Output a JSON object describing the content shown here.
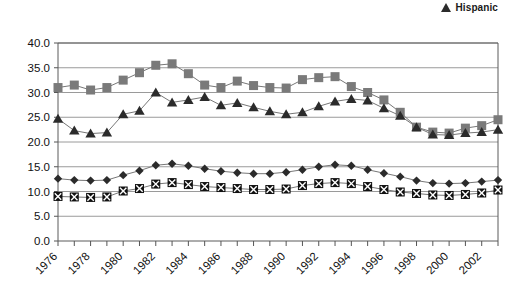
{
  "legend": {
    "items": [
      {
        "label": "Hispanic",
        "marker": "triangle-icon",
        "color": "#2b2b2b"
      }
    ]
  },
  "chart_data": {
    "type": "line",
    "title": "",
    "subtitle": "",
    "xlabel": "",
    "ylabel": "",
    "grid": true,
    "legend_position": "top-right",
    "xlim": [
      1976,
      2003
    ],
    "ylim": [
      0.0,
      40.0
    ],
    "ytick_labels": [
      "40.0",
      "35.0",
      "30.0",
      "25.0",
      "20.0",
      "15.0",
      "10.0",
      "5.0",
      "0.0"
    ],
    "ytick_values": [
      40.0,
      35.0,
      30.0,
      25.0,
      20.0,
      15.0,
      10.0,
      5.0,
      0.0
    ],
    "xtick_labels": [
      "1976",
      "1978",
      "1980",
      "1982",
      "1984",
      "1986",
      "1988",
      "1990",
      "1992",
      "1994",
      "1996",
      "1998",
      "2000",
      "2002"
    ],
    "xtick_values": [
      1976,
      1978,
      1980,
      1982,
      1984,
      1986,
      1988,
      1990,
      1992,
      1994,
      1996,
      1998,
      2000,
      2002
    ],
    "x": [
      1976,
      1977,
      1978,
      1979,
      1980,
      1981,
      1982,
      1983,
      1984,
      1985,
      1986,
      1987,
      1988,
      1989,
      1990,
      1991,
      1992,
      1993,
      1994,
      1995,
      1996,
      1997,
      1998,
      1999,
      2000,
      2001,
      2002,
      2003
    ],
    "series": [
      {
        "name": "square-series",
        "marker": "square",
        "color": "#7a7a7a",
        "values": [
          31.0,
          31.5,
          30.5,
          31.0,
          32.5,
          34.0,
          35.5,
          35.8,
          33.8,
          31.5,
          31.0,
          32.3,
          31.4,
          31.0,
          30.9,
          32.6,
          33.0,
          33.2,
          31.2,
          30.0,
          28.5,
          26.0,
          23.0,
          22.0,
          21.8,
          22.8,
          23.3,
          24.5
        ]
      },
      {
        "name": "triangle-series",
        "marker": "triangle",
        "color": "#2b2b2b",
        "values": [
          24.7,
          22.3,
          21.7,
          21.9,
          25.6,
          26.3,
          30.0,
          28.0,
          28.5,
          29.1,
          27.4,
          27.9,
          27.0,
          26.2,
          25.6,
          26.0,
          27.2,
          28.2,
          28.7,
          28.4,
          26.8,
          25.3,
          23.0,
          21.5,
          21.4,
          21.8,
          22.0,
          22.5
        ]
      },
      {
        "name": "diamond-series",
        "marker": "diamond",
        "color": "#2b2b2b",
        "values": [
          12.6,
          12.3,
          12.2,
          12.3,
          13.3,
          14.2,
          15.3,
          15.6,
          15.2,
          14.6,
          14.1,
          13.8,
          13.6,
          13.6,
          13.9,
          14.4,
          15.0,
          15.4,
          15.2,
          14.4,
          13.7,
          13.0,
          12.2,
          11.7,
          11.6,
          11.7,
          12.0,
          12.3
        ]
      },
      {
        "name": "x-square-series",
        "marker": "x-square",
        "color": "#111111",
        "values": [
          9.0,
          8.9,
          8.8,
          8.9,
          10.1,
          10.6,
          11.5,
          11.8,
          11.4,
          11.0,
          10.8,
          10.6,
          10.4,
          10.4,
          10.5,
          11.2,
          11.6,
          11.8,
          11.6,
          11.0,
          10.4,
          9.9,
          9.6,
          9.3,
          9.2,
          9.4,
          9.7,
          10.3
        ]
      }
    ]
  }
}
